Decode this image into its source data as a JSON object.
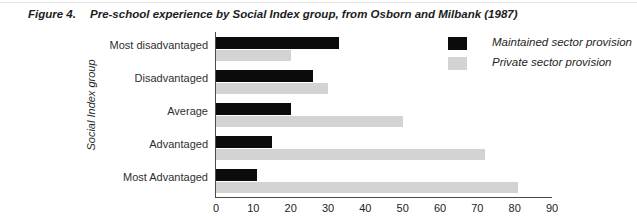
{
  "figure": {
    "label": "Figure 4.",
    "caption": "Pre-school experience by Social Index group, from Osborn and Milbank (1987)"
  },
  "chart_data": {
    "type": "bar",
    "orientation": "horizontal",
    "title": "Pre-school experience by Social Index group, from Osborn and Milbank (1987)",
    "categories": [
      "Most disadvantaged",
      "Disadvantaged",
      "Average",
      "Advantaged",
      "Most Advantaged"
    ],
    "series": [
      {
        "name": "Maintained sector provision",
        "color": "#0b0b0b",
        "values": [
          33,
          26,
          20,
          15,
          11
        ]
      },
      {
        "name": "Private sector provision",
        "color": "#d3d3d3",
        "values": [
          20,
          30,
          50,
          72,
          81
        ]
      }
    ],
    "xlabel": "",
    "ylabel": "Social Index group",
    "xlim": [
      0,
      90
    ],
    "xticks": [
      0,
      10,
      20,
      30,
      40,
      50,
      60,
      70,
      80,
      90
    ],
    "grid": false,
    "legend_position": "top-right",
    "axis_color": "#4a4a4a"
  }
}
